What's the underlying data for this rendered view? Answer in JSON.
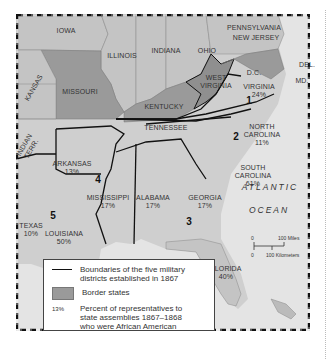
{
  "map": {
    "title": "Military Districts of the Reconstruction South",
    "colors": {
      "border_state": "#9a9a9a",
      "other_state": "#c4c4c4",
      "southern_state": "#cfcfcf",
      "west_virginia": "#8f8f8f",
      "ocean": "#e6e6e6",
      "district_line": "#111111"
    },
    "states": [
      {
        "name": "IOWA",
        "percent": ""
      },
      {
        "name": "ILLINOIS",
        "percent": ""
      },
      {
        "name": "INDIANA",
        "percent": ""
      },
      {
        "name": "OHIO",
        "percent": ""
      },
      {
        "name": "PENNSYLVANIA",
        "percent": ""
      },
      {
        "name": "NEW JERSEY",
        "percent": ""
      },
      {
        "name": "MISSOURI",
        "percent": ""
      },
      {
        "name": "KANSAS",
        "percent": ""
      },
      {
        "name": "KENTUCKY",
        "percent": ""
      },
      {
        "name": "WEST VIRGINIA",
        "percent": ""
      },
      {
        "name": "D.C.",
        "percent": ""
      },
      {
        "name": "DEL.",
        "percent": ""
      },
      {
        "name": "MD.",
        "percent": ""
      },
      {
        "name": "VIRGINIA",
        "percent": "24%"
      },
      {
        "name": "TENNESSEE",
        "percent": ""
      },
      {
        "name": "NORTH CAROLINA",
        "percent": "11%"
      },
      {
        "name": "INDIAN TERR.",
        "percent": ""
      },
      {
        "name": "ARKANSAS",
        "percent": "13%"
      },
      {
        "name": "SOUTH CAROLINA",
        "percent": "61%"
      },
      {
        "name": "MISSISSIPPI",
        "percent": "17%"
      },
      {
        "name": "ALABAMA",
        "percent": "17%"
      },
      {
        "name": "GEORGIA",
        "percent": "17%"
      },
      {
        "name": "TEXAS",
        "percent": "10%"
      },
      {
        "name": "LOUISIANA",
        "percent": "50%"
      },
      {
        "name": "FLORIDA",
        "percent": "40%"
      }
    ],
    "labels": {
      "iowa": "IOWA",
      "illinois": "ILLINOIS",
      "indiana": "INDIANA",
      "ohio": "OHIO",
      "pennsylvania": "PENNSYLVANIA",
      "new_jersey": "NEW JERSEY",
      "missouri": "MISSOURI",
      "kansas": "KANSAS",
      "kentucky": "KENTUCKY",
      "west_virginia_1": "WEST",
      "west_virginia_2": "VIRGINIA",
      "dc": "D.C.",
      "del": "DEL.",
      "md": "MD.",
      "virginia": "VIRGINIA",
      "virginia_pct": "24%",
      "tennessee": "TENNESSEE",
      "north_carolina_1": "NORTH",
      "north_carolina_2": "CAROLINA",
      "north_carolina_pct": "11%",
      "indian_terr_1": "INDIAN",
      "indian_terr_2": "TERR.",
      "arkansas": "ARKANSAS",
      "arkansas_pct": "13%",
      "south_carolina_1": "SOUTH",
      "south_carolina_2": "CAROLINA",
      "south_carolina_pct": "61%",
      "mississippi": "MISSISSIPPI",
      "mississippi_pct": "17%",
      "alabama": "ALABAMA",
      "alabama_pct": "17%",
      "georgia": "GEORGIA",
      "georgia_pct": "17%",
      "texas": "TEXAS",
      "texas_pct": "10%",
      "louisiana": "LOUISIANA",
      "louisiana_pct": "50%",
      "florida": "FLORIDA",
      "florida_pct": "40%",
      "atlantic": "ATLANTIC",
      "ocean": "OCEAN"
    },
    "districts": [
      {
        "number": "1",
        "states": [
          "Virginia"
        ]
      },
      {
        "number": "2",
        "states": [
          "North Carolina",
          "South Carolina"
        ]
      },
      {
        "number": "3",
        "states": [
          "Georgia",
          "Alabama",
          "Florida"
        ]
      },
      {
        "number": "4",
        "states": [
          "Arkansas",
          "Mississippi"
        ]
      },
      {
        "number": "5",
        "states": [
          "Texas",
          "Louisiana"
        ]
      }
    ],
    "scale": {
      "zero_top": "0",
      "miles": "100 Miles",
      "zero_bottom": "0",
      "kilometers": "100 Kilometers"
    }
  },
  "legend": {
    "items": [
      {
        "symbol": "line",
        "text_1": "Boundaries of the five military",
        "text_2": "districts established in 1867"
      },
      {
        "symbol": "swatch",
        "text_1": "Border states"
      },
      {
        "symbol": "13%",
        "text_1": "Percent of representatives to",
        "text_2": "state assemblies 1867–1868",
        "text_3": "who were African American"
      }
    ]
  }
}
